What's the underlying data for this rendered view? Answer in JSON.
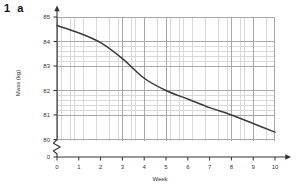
{
  "question": {
    "number": "1",
    "part": "a"
  },
  "chart_data": {
    "type": "line",
    "title": "",
    "xlabel": "Week",
    "ylabel": "Mass (kg)",
    "xlim": [
      0,
      10
    ],
    "ylim": [
      80,
      85
    ],
    "y_axis_break": true,
    "y_axis_break_to": 0,
    "grid": true,
    "grid_minor": true,
    "legend": "none",
    "xticks": [
      "0",
      "1",
      "2",
      "3",
      "4",
      "5",
      "6",
      "7",
      "8",
      "9",
      "10"
    ],
    "yticks": [
      "0",
      "80",
      "81",
      "82",
      "83",
      "84",
      "85"
    ],
    "series": [
      {
        "name": "Mass",
        "color": "#3a3a3a",
        "x": [
          0,
          1,
          2,
          3,
          4,
          5,
          6,
          7,
          8,
          9,
          10
        ],
        "values": [
          84.65,
          84.35,
          83.95,
          83.3,
          82.5,
          82.0,
          81.65,
          81.3,
          81.0,
          80.65,
          80.3
        ]
      }
    ]
  },
  "axes": {
    "y_ticks": [
      {
        "label": "85",
        "y": 17
      },
      {
        "label": "84",
        "y": 41.5
      },
      {
        "label": "83",
        "y": 66
      },
      {
        "label": "82",
        "y": 90.5
      },
      {
        "label": "81",
        "y": 115
      },
      {
        "label": "80",
        "y": 139.5
      },
      {
        "label": "0",
        "y": 157
      }
    ],
    "x_ticks": [
      {
        "label": "0",
        "x": 57
      },
      {
        "label": "1",
        "x": 78.8
      },
      {
        "label": "2",
        "x": 100.6
      },
      {
        "label": "3",
        "x": 122.4
      },
      {
        "label": "4",
        "x": 144.2
      },
      {
        "label": "5",
        "x": 166
      },
      {
        "label": "6",
        "x": 187.8
      },
      {
        "label": "7",
        "x": 209.6
      },
      {
        "label": "8",
        "x": 231.4
      },
      {
        "label": "9",
        "x": 253.2
      },
      {
        "label": "10",
        "x": 275
      }
    ]
  },
  "icons": {
    "y_axis_arrow": "arrow-up-icon",
    "x_axis_arrow": "arrow-right-icon",
    "axis_break": "axis-break-zigzag-icon"
  },
  "colors": {
    "line": "#3a3a3a",
    "axis": "#333333",
    "grid_minor": "#d9d9d9",
    "grid_major": "#a8a8a8",
    "background": "#ffffff"
  }
}
